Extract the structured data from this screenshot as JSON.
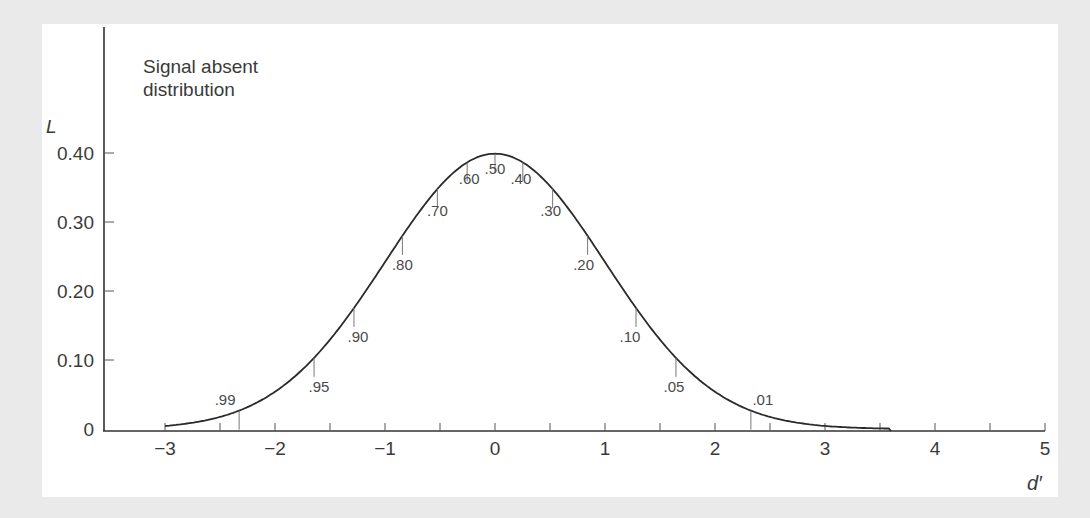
{
  "chart_data": {
    "type": "line",
    "title": "Signal absent distribution",
    "title_lines": [
      "Signal absent",
      "distribution"
    ],
    "xlabel": "d′",
    "ylabel": "L",
    "xlim": [
      -3.5,
      5
    ],
    "ylim": [
      0,
      0.4
    ],
    "x_ticks": [
      -3,
      -2,
      -1,
      0,
      1,
      2,
      3,
      4,
      5
    ],
    "x_tick_labels": [
      "−3",
      "−2",
      "−1",
      "0",
      "1",
      "2",
      "3",
      "4",
      "5"
    ],
    "x_minor_ticks": [
      -2.5,
      -1.5,
      -0.5,
      0.5,
      1.5,
      2.5,
      3.5,
      4.5
    ],
    "y_ticks": [
      0,
      0.1,
      0.2,
      0.3,
      0.4
    ],
    "y_tick_labels": [
      "0",
      "0.10",
      "0.20",
      "0.30",
      "0.40"
    ],
    "grid": false,
    "legend": null,
    "series": [
      {
        "name": "Signal absent distribution (standard normal density)",
        "mean": 0,
        "sd": 1,
        "x": [
          -3,
          -2.5,
          -2,
          -1.5,
          -1,
          -0.5,
          0,
          0.5,
          1,
          1.5,
          2,
          2.5,
          3
        ],
        "values": [
          0.004,
          0.018,
          0.054,
          0.13,
          0.242,
          0.352,
          0.399,
          0.352,
          0.242,
          0.13,
          0.054,
          0.018,
          0.004
        ]
      }
    ],
    "annotations": [
      {
        "label": ".99",
        "x": -2.326
      },
      {
        "label": ".95",
        "x": -1.645
      },
      {
        "label": ".90",
        "x": -1.282
      },
      {
        "label": ".80",
        "x": -0.842
      },
      {
        "label": ".70",
        "x": -0.524
      },
      {
        "label": ".60",
        "x": -0.253
      },
      {
        "label": ".50",
        "x": 0
      },
      {
        "label": ".40",
        "x": 0.253
      },
      {
        "label": ".30",
        "x": 0.524
      },
      {
        "label": ".20",
        "x": 0.842
      },
      {
        "label": ".10",
        "x": 1.282
      },
      {
        "label": ".05",
        "x": 1.645
      },
      {
        "label": ".01",
        "x": 2.326
      }
    ]
  },
  "colors": {
    "background": "#eaeaea",
    "panel": "#ffffff",
    "curve": "#2a2a2a",
    "text": "#3a3a3a"
  }
}
